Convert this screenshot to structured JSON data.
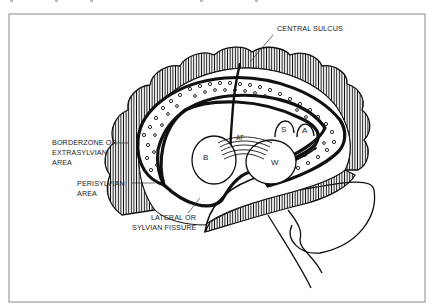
{
  "figure": {
    "type": "brain-lateral-view-diagram",
    "labels": {
      "central_sulcus": "CENTRAL SULCUS",
      "borderzone": [
        "BORDERZONE OR",
        "EXTRASYLVIAN",
        "AREA"
      ],
      "perisylvian": [
        "PERISYLVIAN",
        "AREA"
      ],
      "lateral_fissure": [
        "LATERAL OR",
        "SYLVIAN FISSURE"
      ]
    },
    "regions": {
      "broca": "B",
      "wernicke": "W",
      "arcuate_fasciculus": "AF",
      "supramarginal": "S",
      "angular": "A"
    },
    "colors": {
      "ink": "#111111",
      "frame": "#888888",
      "background": "#ffffff"
    }
  }
}
